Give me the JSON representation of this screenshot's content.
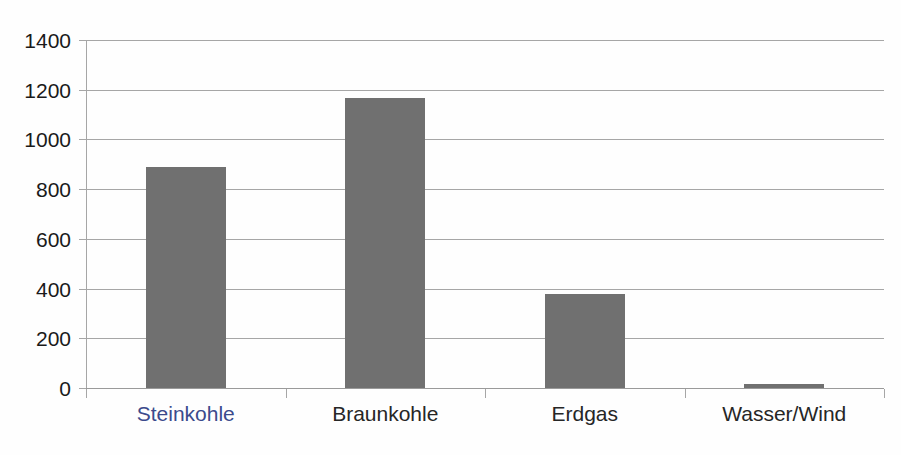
{
  "chart_data": {
    "type": "bar",
    "title": "",
    "subtitle": "",
    "xlabel": "",
    "ylabel": "",
    "categories": [
      "Steinkohle",
      "Braunkohle",
      "Erdgas",
      "Wasser/Wind"
    ],
    "values": [
      890,
      1165,
      380,
      15
    ],
    "series": [
      {
        "name": "",
        "values": [
          890,
          1165,
          380,
          15
        ]
      }
    ],
    "ylim": [
      0,
      1400
    ],
    "yticks": [
      0,
      200,
      400,
      600,
      800,
      1000,
      1200,
      1400
    ],
    "ytick_labels": [
      "0",
      "200",
      "400",
      "600",
      "800",
      "1000",
      "1200",
      "1400"
    ],
    "grid": "horizontal",
    "legend": "none",
    "bar_color": "#707070",
    "gridline_color": "#a6a6a6",
    "axis_color": "#a6a6a6",
    "category_label_colors": [
      "#3b4a8c",
      "#262626",
      "#262626",
      "#262626"
    ],
    "annotations": []
  },
  "ghost_caption": {
    "text": " "
  }
}
